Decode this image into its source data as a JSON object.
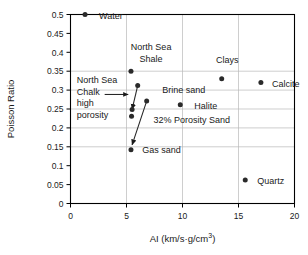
{
  "chart_data": {
    "type": "scatter",
    "title": "",
    "xlabel": "AI (km/s·g/cm3)",
    "xlabel_base": "AI (km/s·g/cm",
    "xlabel_exp": "3",
    "xlabel_tail": ")",
    "ylabel": "Poisson Ratio",
    "xlim": [
      0,
      20
    ],
    "ylim": [
      0,
      0.5
    ],
    "xticks": [
      "0",
      "5",
      "10",
      "15",
      "20"
    ],
    "xtick_values": [
      0,
      5,
      10,
      15,
      20
    ],
    "yticks": [
      "0",
      "0.05",
      "0.1",
      "0.15",
      "0.2",
      "0.25",
      "0.3",
      "0.35",
      "0.4",
      "0.45",
      "0.5"
    ],
    "ytick_values": [
      0,
      0.05,
      0.1,
      0.15,
      0.2,
      0.25,
      0.3,
      0.35,
      0.4,
      0.45,
      0.5
    ],
    "grid": "vertical at 5,10,15; horizontal at 0.15,0.2,0.25,0.3,0.35",
    "gridlines_x": [
      5,
      10,
      15
    ],
    "gridlines_y": [
      0.15,
      0.2,
      0.25,
      0.3,
      0.35
    ],
    "legend": "none",
    "points": [
      {
        "name": "Water",
        "x": 1.3,
        "y": 0.5,
        "label": "Water",
        "label_dx": 14,
        "label_dy": 4,
        "anchor": "start"
      },
      {
        "name": "North Sea Shale",
        "x": 5.4,
        "y": 0.35,
        "label": "",
        "label_dx": 0,
        "label_dy": 0,
        "anchor": "start"
      },
      {
        "name": "North Sea Chalk upper",
        "x": 6.0,
        "y": 0.312,
        "label": "",
        "label_dx": 0,
        "label_dy": 0,
        "anchor": "start"
      },
      {
        "name": "North Sea Chalk mid",
        "x": 5.5,
        "y": 0.249,
        "label": "",
        "label_dx": 0,
        "label_dy": 0,
        "anchor": "start"
      },
      {
        "name": "North Sea Chalk high porosity",
        "x": 5.45,
        "y": 0.231,
        "label": "",
        "label_dx": 0,
        "label_dy": 0,
        "anchor": "start"
      },
      {
        "name": "Brine sand",
        "x": 6.8,
        "y": 0.271,
        "label": "",
        "label_dx": 0,
        "label_dy": 0,
        "anchor": "start"
      },
      {
        "name": "Halite",
        "x": 9.8,
        "y": 0.261,
        "label": "Halite",
        "label_dx": 14,
        "label_dy": 4,
        "anchor": "start"
      },
      {
        "name": "Clays",
        "x": 13.5,
        "y": 0.33,
        "label": "",
        "label_dx": 0,
        "label_dy": 0,
        "anchor": "start"
      },
      {
        "name": "Calcite",
        "x": 17.0,
        "y": 0.32,
        "label": "Calcite",
        "label_dx": 11,
        "label_dy": 4,
        "anchor": "start"
      },
      {
        "name": "Gas sand",
        "x": 5.4,
        "y": 0.142,
        "label": "",
        "label_dx": 0,
        "label_dy": 0,
        "anchor": "start"
      },
      {
        "name": "Quartz",
        "x": 15.6,
        "y": 0.062,
        "label": "Quartz",
        "label_dx": 12,
        "label_dy": 4,
        "anchor": "start"
      }
    ],
    "connectors": [
      {
        "name": "chalk-trend",
        "x1": 6.0,
        "y1": 0.312,
        "x2": 5.5,
        "y2": 0.249,
        "arrow": "end"
      },
      {
        "name": "gas-sand-trend",
        "x1": 6.8,
        "y1": 0.271,
        "x2": 5.5,
        "y2": 0.155,
        "arrow": "end"
      }
    ],
    "annotations": [
      {
        "name": "north-sea-shale",
        "lines": [
          "North Sea",
          "Shale"
        ],
        "x": 7.2,
        "y": 0.405,
        "anchor": "middle"
      },
      {
        "name": "clays",
        "lines": [
          "Clays"
        ],
        "x": 14.0,
        "y": 0.372,
        "anchor": "middle"
      },
      {
        "name": "brine-sand",
        "lines": [
          "Brine sand"
        ],
        "x": 8.2,
        "y": 0.292,
        "anchor": "start"
      },
      {
        "name": "porosity-sand",
        "lines": [
          "32% Porosity Sand"
        ],
        "x": 7.4,
        "y": 0.212,
        "anchor": "start"
      },
      {
        "name": "gas-sand",
        "lines": [
          "Gas sand"
        ],
        "x": 6.4,
        "y": 0.133,
        "anchor": "start"
      },
      {
        "name": "north-sea-chalk",
        "lines": [
          "North Sea",
          "Chalk",
          "high",
          "porosity"
        ],
        "x": 0.55,
        "y": 0.318,
        "anchor": "start"
      }
    ],
    "arrow_annotation": {
      "name": "chalk-pointer",
      "x1": 3.05,
      "y1": 0.2885,
      "x2": 5.15,
      "y2": 0.2885
    }
  }
}
